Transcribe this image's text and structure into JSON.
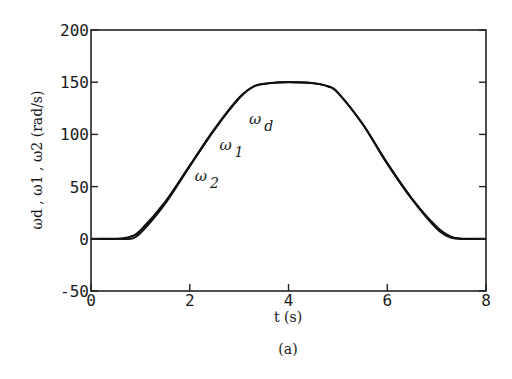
{
  "chart_data": {
    "type": "line",
    "title": "",
    "caption": "(a)",
    "xlabel": "t (s)",
    "ylabel": "ωd , ω1 , ω2 (rad/s)",
    "xlim": [
      0,
      8
    ],
    "ylim": [
      -50,
      200
    ],
    "xticks": [
      0,
      2,
      4,
      6,
      8
    ],
    "yticks": [
      -50,
      0,
      50,
      100,
      150,
      200
    ],
    "xtick_labels": [
      "0",
      "2",
      "4",
      "6",
      "8"
    ],
    "ytick_labels": [
      "-50",
      "0",
      "50",
      "100",
      "150",
      "200"
    ],
    "grid": false,
    "legend": "none (inline curve annotations)",
    "annotations": [
      {
        "text": "ωd",
        "x": 3.2,
        "y": 110
      },
      {
        "text": "ω1",
        "x": 2.6,
        "y": 85
      },
      {
        "text": "ω2",
        "x": 2.1,
        "y": 55
      }
    ],
    "x": [
      0,
      0.5,
      0.8,
      1.0,
      1.5,
      2.0,
      2.5,
      3.0,
      3.3,
      3.6,
      4.0,
      4.5,
      4.8,
      5.0,
      5.5,
      6.0,
      6.5,
      7.0,
      7.3,
      7.6,
      8.0
    ],
    "series": [
      {
        "name": "ωd",
        "values": [
          0,
          0,
          2,
          8,
          35,
          70,
          105,
          135,
          146,
          149,
          150,
          149,
          146,
          140,
          110,
          72,
          38,
          10,
          1,
          0,
          0
        ]
      },
      {
        "name": "ω1",
        "values": [
          0,
          0,
          0,
          6,
          34,
          70,
          105,
          135,
          146,
          149,
          150,
          149,
          146,
          140,
          110,
          72,
          38,
          11,
          2,
          0,
          0
        ]
      },
      {
        "name": "ω2",
        "values": [
          0,
          0,
          0,
          5,
          33,
          69,
          104,
          134,
          146,
          149,
          150,
          149,
          146,
          140,
          110,
          73,
          39,
          12,
          2,
          0,
          0
        ]
      }
    ]
  }
}
